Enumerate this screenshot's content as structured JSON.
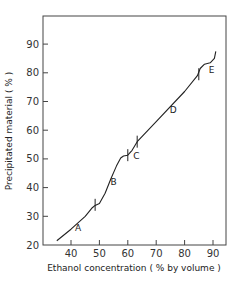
{
  "chart_data": {
    "type": "line",
    "title": "",
    "xlabel": "Ethanol concentration ( % by volume )",
    "ylabel": "Precipitated material ( % )",
    "xlim": [
      30.5,
      94.5
    ],
    "ylim": [
      20,
      100
    ],
    "x_ticks": [
      40,
      50,
      60,
      70,
      80,
      90
    ],
    "y_ticks": [
      20,
      30,
      40,
      50,
      60,
      70,
      80,
      90
    ],
    "grid": false,
    "legend": null,
    "series": [
      {
        "name": "Precipitation curve",
        "x": [
          35,
          40,
          45,
          47.5,
          48.5,
          50,
          52,
          54,
          56,
          57.5,
          58.5,
          60,
          61.5,
          63.3,
          70,
          80,
          84.5,
          85.5,
          87,
          89,
          90.5,
          91
        ],
        "y": [
          21.5,
          25.5,
          30,
          33,
          33.8,
          34.5,
          38,
          43,
          47.5,
          50.3,
          51,
          51.3,
          53,
          56,
          63,
          73.5,
          79,
          81.5,
          83,
          83.5,
          85,
          87.5
        ]
      }
    ],
    "fraction_boundaries": [
      {
        "x": 48.5,
        "y": 34
      },
      {
        "x": 60,
        "y": 51.3
      },
      {
        "x": 63.3,
        "y": 56
      },
      {
        "x": 85,
        "y": 79.5
      }
    ],
    "annotations": [
      {
        "text": "A",
        "x": 42.5,
        "y": 25
      },
      {
        "text": "B",
        "x": 55,
        "y": 41
      },
      {
        "text": "C",
        "x": 63,
        "y": 50
      },
      {
        "text": "D",
        "x": 76,
        "y": 66
      },
      {
        "text": "E",
        "x": 89.5,
        "y": 80
      }
    ]
  }
}
